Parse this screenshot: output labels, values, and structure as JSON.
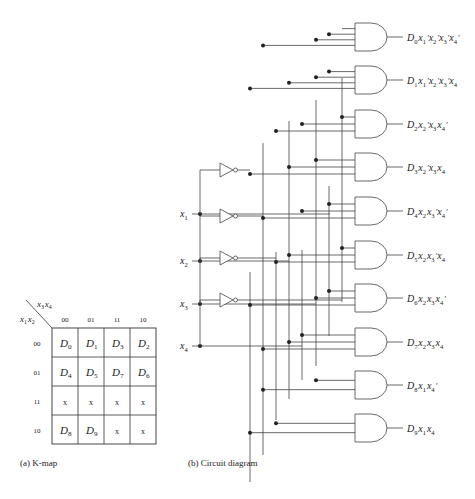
{
  "kmap": {
    "row_var": "x1x2",
    "col_var": "x3x4",
    "col_headers": [
      "00",
      "01",
      "11",
      "10"
    ],
    "row_headers": [
      "00",
      "01",
      "11",
      "10"
    ],
    "cells": [
      [
        "D0",
        "D1",
        "D3",
        "D2"
      ],
      [
        "D4",
        "D5",
        "D7",
        "D6"
      ],
      [
        "x",
        "x",
        "x",
        "x"
      ],
      [
        "D8",
        "D9",
        "x",
        "x"
      ]
    ],
    "caption": "(a) K-map"
  },
  "circuit": {
    "inputs": [
      "x1",
      "x2",
      "x3",
      "x4"
    ],
    "outputs": [
      {
        "name": "D0",
        "expr": "x1'x2'x3'x4'"
      },
      {
        "name": "D1",
        "expr": "x1'x2'x3'x4"
      },
      {
        "name": "D2",
        "expr": "x2'x3x4'"
      },
      {
        "name": "D3",
        "expr": "x2'x3x4"
      },
      {
        "name": "D4",
        "expr": "x2x3'x4'"
      },
      {
        "name": "D5",
        "expr": "x2x3'x4"
      },
      {
        "name": "D6",
        "expr": "x2x3x4'"
      },
      {
        "name": "D7",
        "expr": "x2x3x4"
      },
      {
        "name": "D8",
        "expr": "x1x4'"
      },
      {
        "name": "D9",
        "expr": "x1x4"
      }
    ],
    "caption": "(b) Circuit diagram"
  }
}
